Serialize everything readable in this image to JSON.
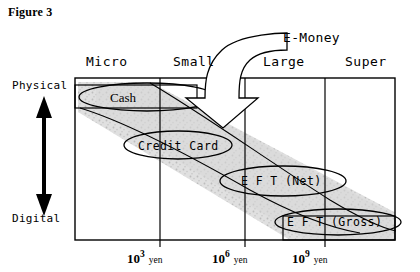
{
  "figure": {
    "label": "Figure 3",
    "columns": [
      {
        "name": "Micro",
        "label": "Micro"
      },
      {
        "name": "Small",
        "label": "Small"
      },
      {
        "name": "Large",
        "label": "Large"
      },
      {
        "name": "Super",
        "label": "Super"
      }
    ],
    "callout": {
      "label": "E-Money",
      "points_to": "Large"
    },
    "y_axis": {
      "top_label": "Physical",
      "bottom_label": "Digital",
      "arrow": "double-headed-vertical-arrow"
    },
    "x_axis": {
      "ticks": [
        {
          "base": "10",
          "exponent": "3",
          "unit": "yen"
        },
        {
          "base": "10",
          "exponent": "6",
          "unit": "yen"
        },
        {
          "base": "10",
          "exponent": "9",
          "unit": "yen"
        }
      ]
    },
    "instruments": [
      {
        "name": "cash",
        "label": "Cash",
        "font": "serif"
      },
      {
        "name": "credit-card",
        "label": "Credit Card",
        "font": "mono"
      },
      {
        "name": "eft-net",
        "label": "E F T  (Net)",
        "font": "mono"
      },
      {
        "name": "eft-gross",
        "label": "E F T  (Gross)",
        "font": "mono"
      }
    ],
    "colors": {
      "ink": "#000000",
      "paper": "#ffffff",
      "band_fill": "#d9d9d9",
      "band_speckle": "#bfbfbf"
    }
  }
}
